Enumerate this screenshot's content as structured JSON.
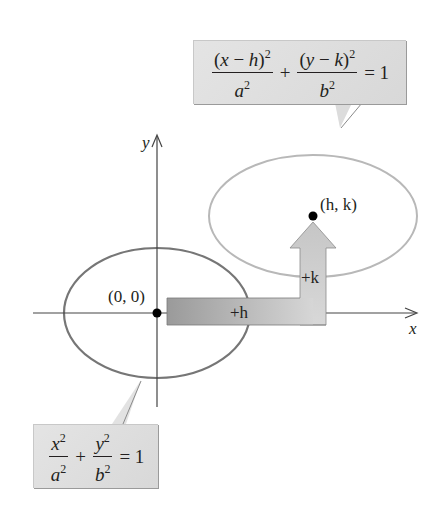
{
  "diagram": {
    "colors": {
      "axis": "#3a3a3a",
      "origin_ellipse": "#777777",
      "translated_ellipse": "#b4b4b4",
      "callout_fill": "#dedede",
      "arrow_fill_dark": "#9c9c9c",
      "arrow_fill_light": "#d9d9d9",
      "point": "#000000"
    },
    "axes": {
      "x_label": "x",
      "y_label": "y"
    },
    "points": {
      "origin_label": "(0, 0)",
      "center_label": "(h, k)"
    },
    "translation_arrow": {
      "horizontal_label": "+h",
      "vertical_label": "+k"
    },
    "callouts": {
      "translated": {
        "num1_open": "(",
        "num1_var": "x",
        "num1_minus": " − ",
        "num1_shift": "h",
        "num1_close": ")",
        "num1_exp": "2",
        "den1_var": "a",
        "den1_exp": "2",
        "plus": "+",
        "num2_open": "(",
        "num2_var": "y",
        "num2_minus": " − ",
        "num2_shift": "k",
        "num2_close": ")",
        "num2_exp": "2",
        "den2_var": "b",
        "den2_exp": "2",
        "equals": "= 1"
      },
      "standard": {
        "num1_var": "x",
        "num1_exp": "2",
        "den1_var": "a",
        "den1_exp": "2",
        "plus": "+",
        "num2_var": "y",
        "num2_exp": "2",
        "den2_var": "b",
        "den2_exp": "2",
        "equals": "= 1"
      }
    }
  }
}
